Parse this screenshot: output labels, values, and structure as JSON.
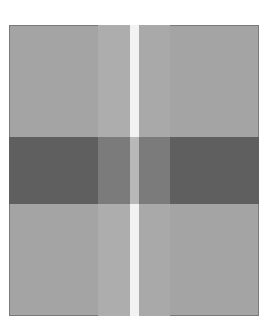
{
  "image": {
    "description": "Grayscale grid illusion: a light gray square crossed by a dark horizontal band and a white vertical stripe flanked by lighter gray columns",
    "colors": {
      "background": "#a4a4a4",
      "light_column": "#adadad",
      "white_stripe": "#f0f0f0",
      "dark_band": "#5f5f5f",
      "dark_band_center": "#7f7f7f",
      "stripe_in_dark": "#b5b5b5",
      "border": "#7a7a7a"
    }
  }
}
